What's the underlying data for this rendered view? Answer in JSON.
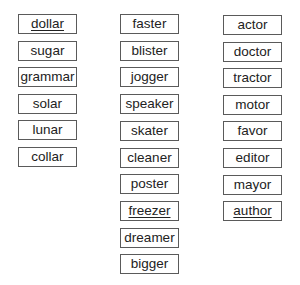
{
  "columns": [
    {
      "name": "ar-words",
      "words": [
        {
          "text": "dollar",
          "underlined": true
        },
        {
          "text": "sugar",
          "underlined": false
        },
        {
          "text": "grammar",
          "underlined": false
        },
        {
          "text": "solar",
          "underlined": false
        },
        {
          "text": "lunar",
          "underlined": false
        },
        {
          "text": "collar",
          "underlined": false
        }
      ]
    },
    {
      "name": "er-words",
      "words": [
        {
          "text": "faster",
          "underlined": false
        },
        {
          "text": "blister",
          "underlined": false
        },
        {
          "text": "jogger",
          "underlined": false
        },
        {
          "text": "speaker",
          "underlined": false
        },
        {
          "text": "skater",
          "underlined": false
        },
        {
          "text": "cleaner",
          "underlined": false
        },
        {
          "text": "poster",
          "underlined": false
        },
        {
          "text": "freezer",
          "underlined": true
        },
        {
          "text": "dreamer",
          "underlined": false
        },
        {
          "text": "bigger",
          "underlined": false
        }
      ]
    },
    {
      "name": "or-words",
      "words": [
        {
          "text": "actor",
          "underlined": false
        },
        {
          "text": "doctor",
          "underlined": false
        },
        {
          "text": "tractor",
          "underlined": false
        },
        {
          "text": "motor",
          "underlined": false
        },
        {
          "text": "favor",
          "underlined": false
        },
        {
          "text": "editor",
          "underlined": false
        },
        {
          "text": "mayor",
          "underlined": false
        },
        {
          "text": "author",
          "underlined": true
        }
      ]
    }
  ],
  "colors": {
    "text": "#222222",
    "border": "#5a5a5a",
    "background": "#ffffff"
  }
}
